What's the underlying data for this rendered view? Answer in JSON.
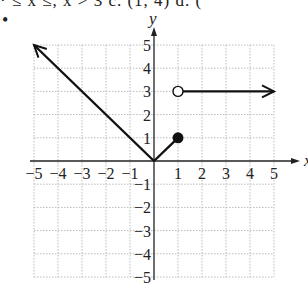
{
  "header": {
    "top_text_fragment": "· ≤ x    ≤, x  > 3  c.  (1, 4)  d.  (",
    "bullet": "•"
  },
  "chart_data": {
    "type": "line",
    "title": "",
    "xlabel": "x",
    "ylabel": "y",
    "xlim": [
      -5,
      5
    ],
    "ylim": [
      -5,
      5
    ],
    "grid": true,
    "x_ticks": [
      "-5",
      "-4",
      "-3",
      "-2",
      "-1",
      "1",
      "2",
      "3",
      "4",
      "5"
    ],
    "y_ticks": [
      "5",
      "4",
      "3",
      "2",
      "1",
      "-1",
      "-2",
      "-3",
      "-4",
      "-5"
    ],
    "series": [
      {
        "name": "piece 1",
        "points": [
          [
            -5,
            5
          ],
          [
            0,
            0
          ]
        ],
        "left_end": "arrow",
        "right_end": "none"
      },
      {
        "name": "piece 2",
        "points": [
          [
            0,
            0
          ],
          [
            1,
            1
          ]
        ],
        "left_end": "none",
        "right_end": "closed-dot"
      },
      {
        "name": "piece 3",
        "points": [
          [
            1,
            3
          ],
          [
            5,
            3
          ]
        ],
        "left_end": "open-dot",
        "right_end": "arrow"
      }
    ]
  }
}
